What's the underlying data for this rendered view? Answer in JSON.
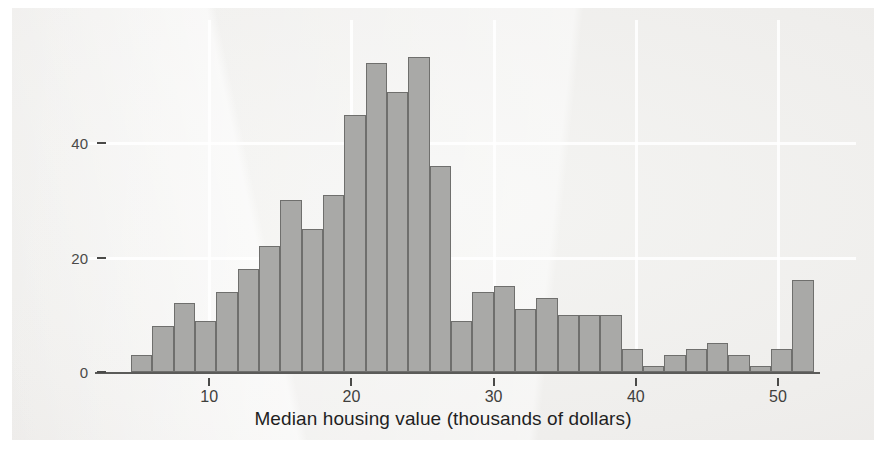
{
  "chart_data": {
    "type": "bar",
    "subtype": "histogram",
    "title": "",
    "subtitle": "",
    "xlabel": "Median housing value (thousands of dollars)",
    "ylabel": "",
    "xlim": [
      3.0,
      52.5
    ],
    "ylim": [
      0,
      57
    ],
    "grid": true,
    "grid_axes": "both",
    "legend": null,
    "legend_position": "none",
    "bin_width": 1.5,
    "bin_start": 4.5,
    "x_ticks": [
      10,
      20,
      30,
      40,
      50
    ],
    "x_tick_labels": [
      "10",
      "20",
      "30",
      "40",
      "50"
    ],
    "y_ticks": [
      0,
      20,
      40
    ],
    "y_tick_labels": [
      "0",
      "20",
      "40"
    ],
    "bar_fill_color": "#a9a9a7",
    "bar_edge_color": "#6f6f6d",
    "background_color": "#efeeec",
    "bins": [
      {
        "left": 4.5,
        "right": 6.0,
        "center": 5.25,
        "count": 3
      },
      {
        "left": 6.0,
        "right": 7.5,
        "center": 6.75,
        "count": 8
      },
      {
        "left": 7.5,
        "right": 9.0,
        "center": 8.25,
        "count": 12
      },
      {
        "left": 9.0,
        "right": 10.5,
        "center": 9.75,
        "count": 9
      },
      {
        "left": 10.5,
        "right": 12.0,
        "center": 11.25,
        "count": 14
      },
      {
        "left": 12.0,
        "right": 13.5,
        "center": 12.75,
        "count": 18
      },
      {
        "left": 13.5,
        "right": 15.0,
        "center": 14.25,
        "count": 22
      },
      {
        "left": 15.0,
        "right": 16.5,
        "center": 15.75,
        "count": 30
      },
      {
        "left": 16.5,
        "right": 18.0,
        "center": 17.25,
        "count": 25
      },
      {
        "left": 18.0,
        "right": 19.5,
        "center": 18.75,
        "count": 31
      },
      {
        "left": 19.5,
        "right": 21.0,
        "center": 20.25,
        "count": 45
      },
      {
        "left": 21.0,
        "right": 22.5,
        "center": 21.75,
        "count": 54
      },
      {
        "left": 22.5,
        "right": 24.0,
        "center": 23.25,
        "count": 49
      },
      {
        "left": 24.0,
        "right": 25.5,
        "center": 24.75,
        "count": 55
      },
      {
        "left": 25.5,
        "right": 27.0,
        "center": 26.25,
        "count": 36
      },
      {
        "left": 27.0,
        "right": 28.5,
        "center": 27.75,
        "count": 9
      },
      {
        "left": 28.5,
        "right": 30.0,
        "center": 29.25,
        "count": 14
      },
      {
        "left": 30.0,
        "right": 31.5,
        "center": 30.75,
        "count": 15
      },
      {
        "left": 31.5,
        "right": 33.0,
        "center": 32.25,
        "count": 11
      },
      {
        "left": 33.0,
        "right": 34.5,
        "center": 33.75,
        "count": 13
      },
      {
        "left": 34.5,
        "right": 36.0,
        "center": 35.25,
        "count": 10
      },
      {
        "left": 36.0,
        "right": 37.5,
        "center": 36.75,
        "count": 10
      },
      {
        "left": 37.5,
        "right": 39.0,
        "center": 38.25,
        "count": 10
      },
      {
        "left": 39.0,
        "right": 40.5,
        "center": 39.75,
        "count": 4
      },
      {
        "left": 40.5,
        "right": 42.0,
        "center": 41.25,
        "count": 1
      },
      {
        "left": 42.0,
        "right": 43.5,
        "center": 42.75,
        "count": 3
      },
      {
        "left": 43.5,
        "right": 45.0,
        "center": 44.25,
        "count": 4
      },
      {
        "left": 45.0,
        "right": 46.5,
        "center": 45.75,
        "count": 5
      },
      {
        "left": 46.5,
        "right": 48.0,
        "center": 47.25,
        "count": 3
      },
      {
        "left": 48.0,
        "right": 49.5,
        "center": 48.75,
        "count": 1
      },
      {
        "left": 49.5,
        "right": 51.0,
        "center": 50.25,
        "count": 4
      },
      {
        "left": 51.0,
        "right": 52.5,
        "center": 51.75,
        "count": 16
      }
    ],
    "categories": [
      "5.25",
      "6.75",
      "8.25",
      "9.75",
      "11.25",
      "12.75",
      "14.25",
      "15.75",
      "17.25",
      "18.75",
      "20.25",
      "21.75",
      "23.25",
      "24.75",
      "26.25",
      "27.75",
      "29.25",
      "30.75",
      "32.25",
      "33.75",
      "35.25",
      "36.75",
      "38.25",
      "39.75",
      "41.25",
      "42.75",
      "44.25",
      "45.75",
      "47.25",
      "48.75",
      "50.25",
      "51.75"
    ],
    "values": [
      3,
      8,
      12,
      9,
      14,
      18,
      22,
      30,
      25,
      31,
      45,
      54,
      49,
      55,
      36,
      9,
      14,
      15,
      11,
      13,
      10,
      10,
      10,
      4,
      1,
      3,
      4,
      5,
      3,
      1,
      4,
      16
    ]
  }
}
